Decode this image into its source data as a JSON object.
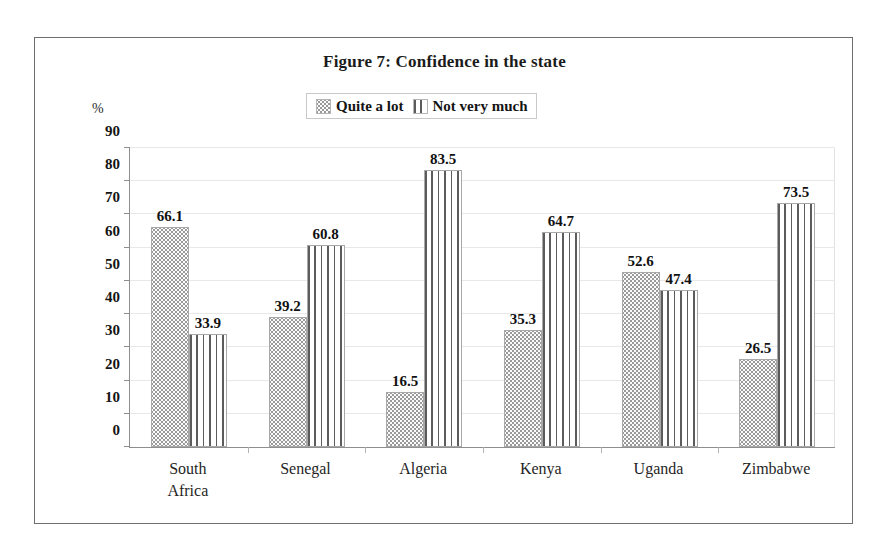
{
  "figure": {
    "title": "Figure 7: Confidence in the state",
    "axis_unit_label": "%"
  },
  "legend": {
    "position": "top-center",
    "items": [
      {
        "label": "Quite a lot",
        "pattern": "dots",
        "swatch_name": "legend-swatch-quite-a-lot"
      },
      {
        "label": "Not very much",
        "pattern": "vlines",
        "swatch_name": "legend-swatch-not-very-much"
      }
    ]
  },
  "chart_data": {
    "type": "bar",
    "title": "Figure 7: Confidence in the state",
    "xlabel": "",
    "ylabel": "%",
    "ylim": [
      0,
      90
    ],
    "yticks": [
      0,
      10,
      20,
      30,
      40,
      50,
      60,
      70,
      80,
      90
    ],
    "ytick_labels": [
      "0",
      "10",
      "20",
      "30",
      "40",
      "50",
      "60",
      "70",
      "80",
      "90"
    ],
    "grid": true,
    "legend_position": "top-center",
    "categories": [
      "South\nAfrica",
      "Senegal",
      "Algeria",
      "Kenya",
      "Uganda",
      "Zimbabwe"
    ],
    "category_labels_flat": [
      "South Africa",
      "Senegal",
      "Algeria",
      "Kenya",
      "Uganda",
      "Zimbabwe"
    ],
    "series": [
      {
        "name": "Quite a lot",
        "pattern": "dots",
        "values": [
          66.1,
          39.2,
          16.5,
          35.3,
          52.6,
          26.5
        ],
        "value_labels": [
          "66.1",
          "39.2",
          "16.5",
          "35.3",
          "52.6",
          "26.5"
        ]
      },
      {
        "name": "Not very much",
        "pattern": "vlines",
        "values": [
          33.9,
          60.8,
          83.5,
          64.7,
          47.4,
          73.5
        ],
        "value_labels": [
          "33.9",
          "60.8",
          "83.5",
          "64.7",
          "47.4",
          "73.5"
        ]
      }
    ]
  },
  "colors": {
    "frame": "#6e6e6e",
    "axis": "#8e8e8e",
    "gridline": "#e8e8e8",
    "dots_pattern": "#9a9a9a",
    "lines_pattern": "#5c5c5c",
    "text": "#141414"
  }
}
